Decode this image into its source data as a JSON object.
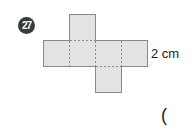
{
  "problem": {
    "number": "27",
    "dimension_label": "2 cm",
    "answer_paren": "("
  },
  "figure": {
    "type": "cube-net",
    "face_fill": "#e3e3e3",
    "edge_color": "#8a8a8a",
    "fold_line_color": "#8a8a8a"
  }
}
